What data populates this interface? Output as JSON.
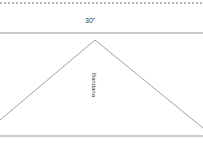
{
  "diagram": {
    "dimension_label": "30\"",
    "shape_label": "Bandana",
    "shape": "triangle",
    "colors": {
      "line": "#888888",
      "dots": "#b8b8b8",
      "text": "#333333"
    }
  }
}
